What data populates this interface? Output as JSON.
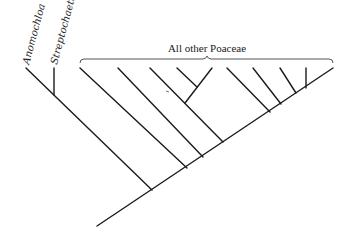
{
  "diagram": {
    "type": "phylogenetic-tree",
    "taxa": [
      {
        "id": "anomochloa",
        "label": "Anomochloa",
        "italic": true
      },
      {
        "id": "streptochaeta",
        "label": "Streptochaeta",
        "italic": true
      }
    ],
    "clade_bracket": {
      "label": "All other Poaceae"
    },
    "colors": {
      "line": "#1a1a1a",
      "bracket": "#555555",
      "text": "#222222",
      "background": "#ffffff"
    }
  }
}
